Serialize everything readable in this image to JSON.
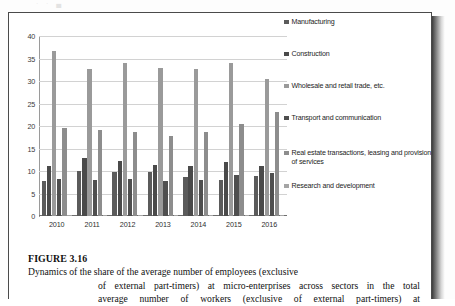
{
  "page": {
    "remnant_text": "· · ▄"
  },
  "figure": {
    "label": "FIGURE 3.16",
    "caption_lines": [
      "Dynamics of the share of the average number of employees (exclusive",
      "of external part-timers) at micro-enterprises across sectors in the total",
      "average number of workers (exclusive of external part-timers) at"
    ]
  },
  "chart_data": {
    "type": "bar",
    "title": "",
    "xlabel": "",
    "ylabel": "",
    "ylim": [
      0,
      40
    ],
    "yticks": [
      0,
      5,
      10,
      15,
      20,
      25,
      30,
      35,
      40
    ],
    "grid": true,
    "legend_position": "right",
    "categories": [
      "2010",
      "2011",
      "2012",
      "2013",
      "2014",
      "2015",
      "2016"
    ],
    "series": [
      {
        "name": "Manufacturing",
        "color": "#5b5b5b",
        "values": [
          7.8,
          10.0,
          9.7,
          9.7,
          8.7,
          8.0,
          9.0
        ]
      },
      {
        "name": "Construction",
        "color": "#4a4a4a",
        "values": [
          11.1,
          13.0,
          12.2,
          11.3,
          11.1,
          12.0,
          11.2
        ]
      },
      {
        "name": "Wholesale and retail trade, etc.",
        "color": "#9a9a9a",
        "values": [
          36.7,
          32.6,
          34.0,
          33.0,
          32.6,
          34.0,
          30.4
        ]
      },
      {
        "name": "Transport and communication",
        "color": "#4f4f4f",
        "values": [
          8.2,
          8.0,
          8.3,
          7.8,
          8.1,
          9.2,
          9.5
        ]
      },
      {
        "name": "Real estate transactions, leasing and provision of services",
        "color": "#8d8d8d",
        "values": [
          19.5,
          19.1,
          18.7,
          17.7,
          18.6,
          20.4,
          23.2
        ]
      },
      {
        "name": "Research and development",
        "color": "#a5a5a5",
        "values": [
          0.3,
          0.3,
          0.3,
          0.3,
          0.3,
          0.3,
          0.3
        ]
      }
    ]
  },
  "legend": {
    "items": [
      {
        "label": "Manufacturing",
        "color": "#5b5b5b"
      },
      {
        "label": "Construction",
        "color": "#4a4a4a"
      },
      {
        "label": "Wholesale and retail trade, etc.",
        "color": "#9a9a9a"
      },
      {
        "label": "Transport and communication",
        "color": "#4f4f4f"
      },
      {
        "label": "Real estate transactions, leasing and provision of services",
        "color": "#8d8d8d"
      },
      {
        "label": "Research and development",
        "color": "#a5a5a5"
      }
    ]
  }
}
